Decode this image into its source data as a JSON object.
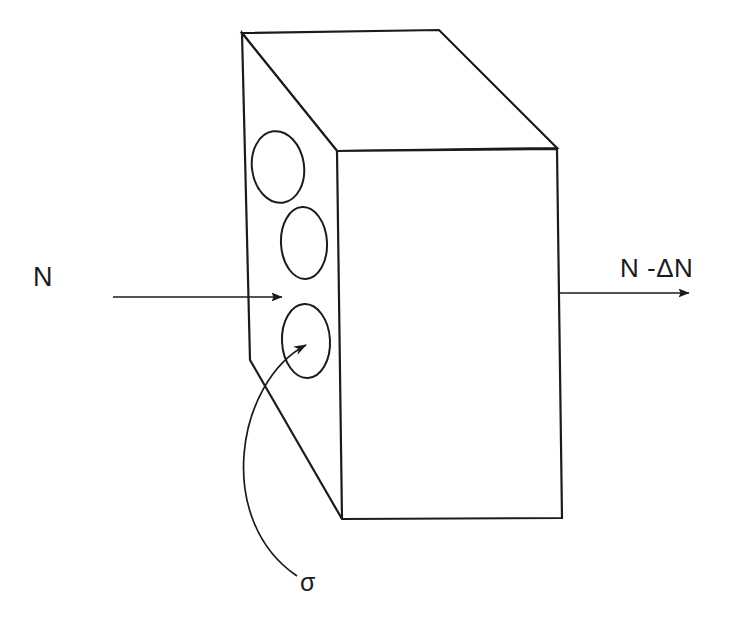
{
  "figure": {
    "background_color": "#ffffff",
    "stroke_color": "#1b1b1b",
    "labels": {
      "incident_beam": "N",
      "transmitted_beam": "N -ΔN",
      "cross_section": "σ"
    },
    "icons": {
      "slab": "rectangular-slab-3d",
      "nuclei": "target-nuclei-ellipses",
      "incident_arrow": "arrow-right",
      "transmitted_arrow": "arrow-right",
      "leader": "curved-leader-line-arrow"
    },
    "geometry": {
      "slab": {
        "top_face": "242,33 439,30 557,148 337,151",
        "front_face": "337,151 557,149 562,518 342,519 250,360 242,33",
        "left_edge_x": 242,
        "front_top_y": 151,
        "front_bottom_y": 518,
        "right_edge_x": 558
      },
      "nuclei": [
        {
          "cx": 278,
          "cy": 167,
          "rx": 26,
          "ry": 36,
          "rot": -8
        },
        {
          "cx": 304,
          "cy": 243,
          "rx": 23,
          "ry": 36,
          "rot": -3
        },
        {
          "cx": 306,
          "cy": 341,
          "rx": 24,
          "ry": 37,
          "rot": -3
        }
      ],
      "incident_arrow": {
        "x1": 113,
        "y1": 297,
        "x2": 284,
        "y2": 297
      },
      "transmitted_arrow": {
        "x1": 558,
        "y1": 293,
        "x2": 691,
        "y2": 293
      },
      "leader_curve": {
        "start": "297,576",
        "control1": "214,520",
        "control2": "236,382",
        "end": "308,344"
      }
    }
  }
}
